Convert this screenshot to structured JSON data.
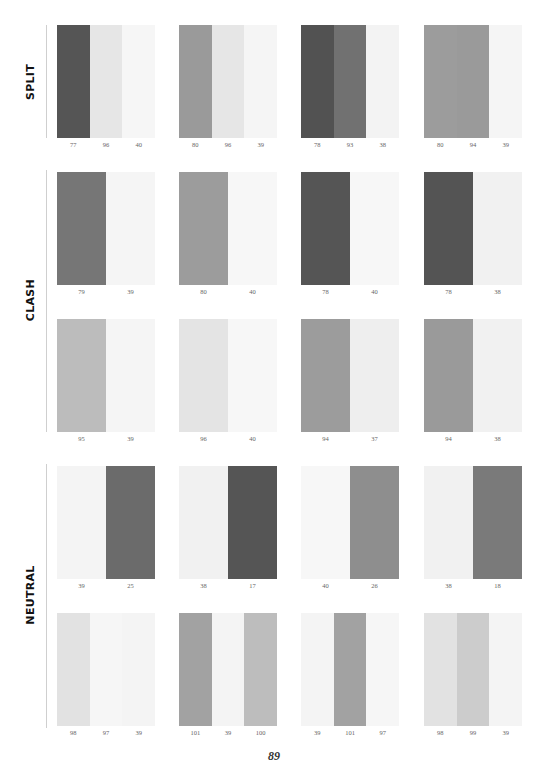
{
  "page": {
    "number": "89"
  },
  "sections": [
    {
      "label": "SPLIT",
      "rows": [
        {
          "swatches": [
            {
              "stripes": [
                {
                  "value": "77",
                  "color": "#555555"
                },
                {
                  "value": "96",
                  "color": "#e6e6e6"
                },
                {
                  "value": "40",
                  "color": "#f6f6f6"
                }
              ]
            },
            {
              "stripes": [
                {
                  "value": "80",
                  "color": "#9a9a9a"
                },
                {
                  "value": "96",
                  "color": "#e6e6e6"
                },
                {
                  "value": "39",
                  "color": "#f5f5f5"
                }
              ]
            },
            {
              "stripes": [
                {
                  "value": "78",
                  "color": "#525252"
                },
                {
                  "value": "93",
                  "color": "#717171"
                },
                {
                  "value": "38",
                  "color": "#f3f3f3"
                }
              ]
            },
            {
              "stripes": [
                {
                  "value": "80",
                  "color": "#9c9c9c"
                },
                {
                  "value": "94",
                  "color": "#9a9a9a"
                },
                {
                  "value": "39",
                  "color": "#f5f5f5"
                }
              ]
            }
          ]
        }
      ]
    },
    {
      "label": "CLASH",
      "rows": [
        {
          "swatches": [
            {
              "stripes": [
                {
                  "value": "79",
                  "color": "#767676"
                },
                {
                  "value": "39",
                  "color": "#f5f5f5"
                }
              ]
            },
            {
              "stripes": [
                {
                  "value": "80",
                  "color": "#9c9c9c"
                },
                {
                  "value": "40",
                  "color": "#f7f7f7"
                }
              ]
            },
            {
              "stripes": [
                {
                  "value": "78",
                  "color": "#555555"
                },
                {
                  "value": "40",
                  "color": "#f7f7f7"
                }
              ]
            },
            {
              "stripes": [
                {
                  "value": "78",
                  "color": "#545454"
                },
                {
                  "value": "38",
                  "color": "#f1f1f1"
                }
              ]
            }
          ]
        },
        {
          "swatches": [
            {
              "stripes": [
                {
                  "value": "95",
                  "color": "#bcbcbc"
                },
                {
                  "value": "39",
                  "color": "#f5f5f5"
                }
              ]
            },
            {
              "stripes": [
                {
                  "value": "96",
                  "color": "#e4e4e4"
                },
                {
                  "value": "40",
                  "color": "#f7f7f7"
                }
              ]
            },
            {
              "stripes": [
                {
                  "value": "94",
                  "color": "#9c9c9c"
                },
                {
                  "value": "37",
                  "color": "#eeeeee"
                }
              ]
            },
            {
              "stripes": [
                {
                  "value": "94",
                  "color": "#9a9a9a"
                },
                {
                  "value": "38",
                  "color": "#f1f1f1"
                }
              ]
            }
          ]
        }
      ]
    },
    {
      "label": "NEUTRAL",
      "rows": [
        {
          "swatches": [
            {
              "stripes": [
                {
                  "value": "39",
                  "color": "#f4f4f4"
                },
                {
                  "value": "25",
                  "color": "#6b6b6b"
                }
              ]
            },
            {
              "stripes": [
                {
                  "value": "38",
                  "color": "#f1f1f1"
                },
                {
                  "value": "17",
                  "color": "#555555"
                }
              ]
            },
            {
              "stripes": [
                {
                  "value": "40",
                  "color": "#f7f7f7"
                },
                {
                  "value": "26",
                  "color": "#8e8e8e"
                }
              ]
            },
            {
              "stripes": [
                {
                  "value": "38",
                  "color": "#f1f1f1"
                },
                {
                  "value": "18",
                  "color": "#7a7a7a"
                }
              ]
            }
          ]
        },
        {
          "swatches": [
            {
              "stripes": [
                {
                  "value": "98",
                  "color": "#e2e2e2"
                },
                {
                  "value": "97",
                  "color": "#f6f6f6"
                },
                {
                  "value": "39",
                  "color": "#f4f4f4"
                }
              ]
            },
            {
              "stripes": [
                {
                  "value": "101",
                  "color": "#a2a2a2"
                },
                {
                  "value": "39",
                  "color": "#f4f4f4"
                },
                {
                  "value": "100",
                  "color": "#bdbdbd"
                }
              ]
            },
            {
              "stripes": [
                {
                  "value": "39",
                  "color": "#f4f4f4"
                },
                {
                  "value": "101",
                  "color": "#a2a2a2"
                },
                {
                  "value": "97",
                  "color": "#f6f6f6"
                }
              ]
            },
            {
              "stripes": [
                {
                  "value": "98",
                  "color": "#e2e2e2"
                },
                {
                  "value": "99",
                  "color": "#cccccc"
                },
                {
                  "value": "39",
                  "color": "#f4f4f4"
                }
              ]
            }
          ]
        }
      ]
    }
  ]
}
